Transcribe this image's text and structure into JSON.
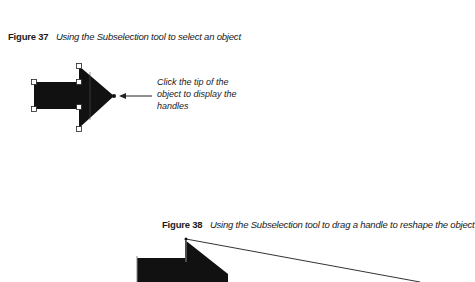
{
  "figure37": {
    "label": "Figure 37",
    "caption": "Using the Subselection tool to select an object",
    "callout": "Click the tip of the object to display the handles",
    "shape": "arrow-right",
    "handles_shown": true
  },
  "figure38": {
    "label": "Figure 38",
    "caption": "Using the Subselection tool to drag a handle to reshape the object",
    "shape": "arrow-right-reshaped"
  },
  "colors": {
    "shape_fill": "#111111",
    "handle_fill": "#ffffff",
    "text": "#1a1a1a"
  }
}
